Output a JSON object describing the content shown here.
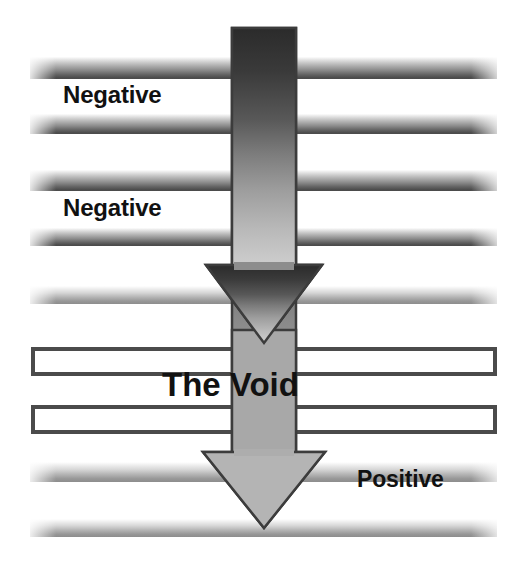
{
  "diagram": {
    "title": "The Void",
    "width": 525,
    "height": 567,
    "background_color": "#ffffff",
    "labels": {
      "negative_upper": "Negative",
      "negative_lower": "Negative",
      "void": "The Void",
      "positive": "Positive"
    },
    "arrow": {
      "name": "downward-arrow",
      "direction": "down",
      "fill_start_color": "#2e2e2e",
      "fill_end_color": "#c9c9c9",
      "outline_color": "#3a3a3a",
      "shaft_left": 232,
      "shaft_right": 296,
      "shaft_top": 28,
      "tip_bottom": 528,
      "head_count": 2
    },
    "bars": [
      {
        "name": "bar-1",
        "style": "gradient",
        "top": 57,
        "height": 22,
        "fill": "#4d4d4d"
      },
      {
        "name": "bar-2",
        "style": "gradient",
        "top": 114,
        "height": 20,
        "fill": "#4d4d4d"
      },
      {
        "name": "bar-3",
        "style": "gradient",
        "top": 170,
        "height": 21,
        "fill": "#4d4d4d"
      },
      {
        "name": "bar-4",
        "style": "gradient",
        "top": 228,
        "height": 18,
        "fill": "#4d4d4d"
      },
      {
        "name": "bar-5",
        "style": "gradient-pale",
        "top": 286,
        "height": 18,
        "fill": "#8d8d8d"
      },
      {
        "name": "bar-6",
        "style": "hollow",
        "top": 347,
        "height": 29,
        "stroke": "#4b4b4b"
      },
      {
        "name": "bar-7",
        "style": "hollow",
        "top": 405,
        "height": 29,
        "stroke": "#4b4b4b"
      },
      {
        "name": "bar-8",
        "style": "gradient-pale",
        "top": 462,
        "height": 20,
        "fill": "#8d8d8d"
      },
      {
        "name": "bar-9",
        "style": "gradient-pale",
        "top": 519,
        "height": 18,
        "fill": "#8d8d8d"
      }
    ]
  }
}
